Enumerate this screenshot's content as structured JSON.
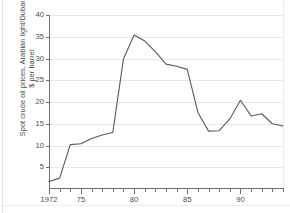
{
  "chart_data": {
    "type": "line",
    "title": "",
    "subtitle": "",
    "xlabel": "",
    "ylabel": "Spot crude oil prices, Arabian light/Dubai",
    "ylabel_line2": "$ per barrel",
    "ylim": [
      0,
      40
    ],
    "xlim": [
      1972,
      1994
    ],
    "grid": true,
    "legend": "none",
    "line_color": "#5a5a5a",
    "background_color": "#ffffff",
    "gridline_color": "#e8e8e8",
    "axis_color": "#6f6f6f",
    "ytick_values": [
      5,
      10,
      15,
      20,
      25,
      30,
      35,
      40
    ],
    "ytick_labels": [
      "5",
      "10",
      "15",
      "20",
      "25",
      "30",
      "35",
      "40"
    ],
    "xtick_values": [
      1972,
      1973,
      1974,
      1975,
      1976,
      1977,
      1978,
      1979,
      1980,
      1981,
      1982,
      1983,
      1984,
      1985,
      1986,
      1987,
      1988,
      1989,
      1990,
      1991,
      1992,
      1993,
      1994
    ],
    "xtick_major": [
      1972,
      1975,
      1980,
      1985,
      1990
    ],
    "xtick_major_labels": [
      "1972",
      "75",
      "80",
      "85",
      "90"
    ],
    "x": [
      1972,
      1973,
      1974,
      1975,
      1976,
      1977,
      1978,
      1979,
      1980,
      1981,
      1982,
      1983,
      1984,
      1985,
      1986,
      1987,
      1988,
      1989,
      1990,
      1991,
      1992,
      1993,
      1994
    ],
    "values": [
      1.7,
      2.5,
      10.2,
      10.4,
      11.6,
      12.4,
      13.0,
      29.9,
      35.4,
      34.0,
      31.6,
      28.7,
      28.2,
      27.5,
      17.6,
      13.3,
      13.4,
      16.1,
      20.4,
      16.8,
      17.3,
      15.0,
      14.5
    ],
    "series_name": "Spot crude oil prices, Arabian light/Dubai"
  }
}
